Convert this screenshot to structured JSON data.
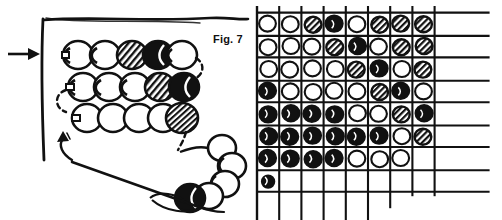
{
  "figure": {
    "label": "Fig. 7",
    "title": "Fig. 7",
    "ink_color": "#111111",
    "background_color": "#ffffff"
  },
  "left_panel": {
    "name": "bead-weaving-diagram",
    "description": "Hand-drawn beading diagram showing three horizontal rows of beads worked off a vertical thread edge, with a dangling strand of beads ending at a needle.",
    "entry_arrow": {
      "label": "",
      "direction": "right",
      "x": 17,
      "y": 55
    },
    "turn_arrow": {
      "label": "",
      "direction": "up-curved",
      "x": 60,
      "y": 140
    },
    "bead_legend": {
      "white": "open / light bead",
      "hatched": "striped / medium bead",
      "black": "filled / dark bead"
    },
    "bead_rows": [
      {
        "row": 1,
        "beads": [
          "white",
          "white",
          "hatched",
          "black",
          "white"
        ]
      },
      {
        "row": 2,
        "beads": [
          "white",
          "white",
          "white",
          "hatched",
          "black"
        ]
      },
      {
        "row": 3,
        "beads": [
          "white",
          "white",
          "white",
          "white",
          "hatched"
        ]
      }
    ],
    "hanging_strand": {
      "beads": [
        "white",
        "white",
        "white",
        "white",
        "black"
      ],
      "needle": "sewing-needle-with-thread"
    }
  },
  "right_panel": {
    "name": "bead-pattern-chart",
    "description": "Grid chart of bead placements; 8 columns by 8 rows, last row only partly filled.",
    "columns": 8,
    "rows": 8,
    "symbols": {
      "white": "O",
      "hatched": "/",
      "black": "@",
      "empty": ""
    }
  },
  "chart_data": {
    "type": "heatmap",
    "title": "Fig. 7",
    "xlabel": "",
    "ylabel": "",
    "grid": true,
    "legend": [
      "white",
      "hatched",
      "black"
    ],
    "categories": [
      "1",
      "2",
      "3",
      "4",
      "5",
      "6",
      "7",
      "8"
    ],
    "row_labels": [
      "1",
      "2",
      "3",
      "4",
      "5",
      "6",
      "7",
      "8"
    ],
    "value_map": {
      "white": 0,
      "hatched": 1,
      "black": 2,
      "empty": null
    },
    "cells": [
      [
        "white",
        "white",
        "hatched",
        "black",
        "white",
        "hatched",
        "hatched",
        "hatched"
      ],
      [
        "white",
        "white",
        "white",
        "hatched",
        "black",
        "white",
        "hatched",
        "hatched"
      ],
      [
        "white",
        "white",
        "white",
        "white",
        "hatched",
        "black",
        "white",
        "hatched"
      ],
      [
        "black",
        "white",
        "white",
        "white",
        "white",
        "hatched",
        "black",
        "white"
      ],
      [
        "black",
        "black",
        "black",
        "black",
        "white",
        "white",
        "hatched",
        "black"
      ],
      [
        "black",
        "black",
        "black",
        "black",
        "black",
        "black",
        "white",
        "hatched"
      ],
      [
        "black",
        "black",
        "black",
        "black",
        "white",
        "white",
        "white",
        "empty"
      ],
      [
        "black",
        "empty",
        "empty",
        "empty",
        "empty",
        "empty",
        "empty",
        "empty"
      ]
    ],
    "values": [
      [
        0,
        0,
        1,
        2,
        0,
        1,
        1,
        1
      ],
      [
        0,
        0,
        0,
        1,
        2,
        0,
        1,
        1
      ],
      [
        0,
        0,
        0,
        0,
        1,
        2,
        0,
        1
      ],
      [
        2,
        0,
        0,
        0,
        0,
        1,
        2,
        0
      ],
      [
        2,
        2,
        2,
        2,
        0,
        0,
        1,
        2
      ],
      [
        2,
        2,
        2,
        2,
        2,
        2,
        0,
        1
      ],
      [
        2,
        2,
        2,
        2,
        0,
        0,
        0,
        null
      ],
      [
        2,
        null,
        null,
        null,
        null,
        null,
        null,
        null
      ]
    ]
  }
}
